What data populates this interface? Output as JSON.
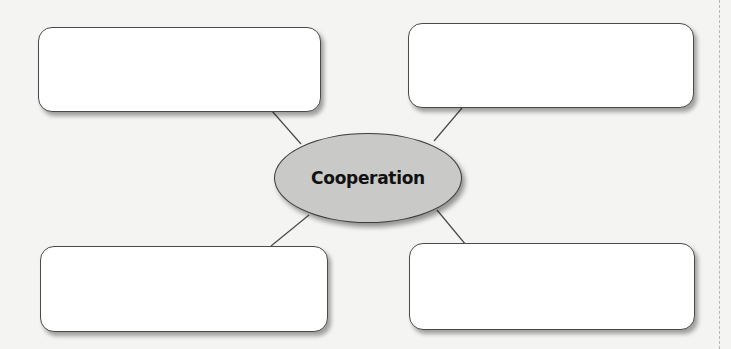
{
  "diagram": {
    "type": "concept-web",
    "center": {
      "label": "Cooperation",
      "fill": "#c9c9c7"
    },
    "boxes": [
      {
        "position": "top-left",
        "text": ""
      },
      {
        "position": "top-right",
        "text": ""
      },
      {
        "position": "bottom-left",
        "text": ""
      },
      {
        "position": "bottom-right",
        "text": ""
      }
    ]
  },
  "colors": {
    "background": "#f4f4f2",
    "box_fill": "#ffffff",
    "stroke": "#4a4a4a",
    "center_fill": "#c9c9c7"
  }
}
